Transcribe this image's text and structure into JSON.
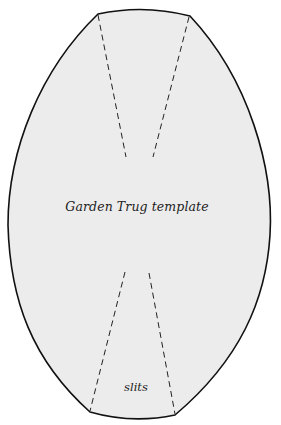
{
  "template": {
    "title": "Garden Trug template",
    "slits_label": "slits"
  },
  "colors": {
    "fill": "#ececec",
    "outline": "#111111",
    "dash": "#222222",
    "text": "#222222"
  }
}
